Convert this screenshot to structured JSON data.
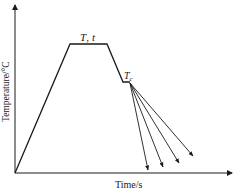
{
  "diagram": {
    "type": "heat-treatment-profile",
    "x_axis_label": "Time/s",
    "y_axis_label": "Temperature/°C",
    "plateau_label_T": "T",
    "plateau_label_sep": ",",
    "plateau_label_t": "t",
    "quench_label_T": "T",
    "quench_label_sub": "c",
    "cooling_paths": 4,
    "line_color": "#1a1a1a"
  }
}
